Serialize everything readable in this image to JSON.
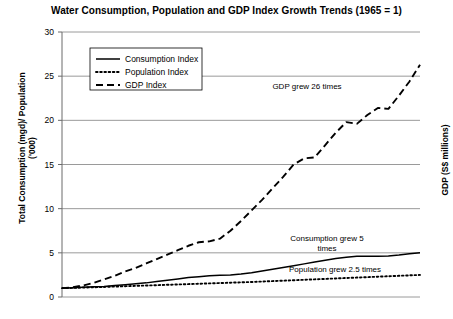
{
  "chart_data": {
    "type": "line",
    "title": "Water Consumption, Population and GDP Index Growth Trends (1965 = 1)",
    "xlabel": "",
    "ylabel": "Total Consumption (mgd)/ Population ('000)",
    "ylabel_right": "GDP (S$ millions)",
    "ylim": [
      0,
      30
    ],
    "yticks": [
      0,
      5,
      10,
      15,
      20,
      25,
      30
    ],
    "ytick_labels": [
      "0",
      "5",
      "10",
      "15",
      "20",
      "25",
      "30"
    ],
    "xlim": [
      0,
      34
    ],
    "xticks": [],
    "xtick_labels": [],
    "grid": "horizontal",
    "legend_position": "upper-left-inside",
    "x": [
      0,
      1,
      2,
      3,
      4,
      5,
      6,
      7,
      8,
      9,
      10,
      11,
      12,
      13,
      14,
      15,
      16,
      17,
      18,
      19,
      20,
      21,
      22,
      23,
      24,
      25,
      26,
      27,
      28,
      29,
      30,
      31,
      32,
      33,
      34
    ],
    "series": [
      {
        "name": "Consumption Index",
        "style": "solid",
        "color": "#000000",
        "values": [
          1.0,
          1.05,
          1.1,
          1.15,
          1.2,
          1.3,
          1.4,
          1.5,
          1.6,
          1.75,
          1.9,
          2.05,
          2.2,
          2.3,
          2.4,
          2.45,
          2.5,
          2.6,
          2.75,
          2.95,
          3.15,
          3.35,
          3.55,
          3.75,
          3.95,
          4.15,
          4.35,
          4.5,
          4.6,
          4.6,
          4.6,
          4.65,
          4.75,
          4.9,
          5.0
        ]
      },
      {
        "name": "Population Index",
        "style": "dotted",
        "color": "#000000",
        "values": [
          1.0,
          1.03,
          1.07,
          1.1,
          1.14,
          1.18,
          1.22,
          1.26,
          1.3,
          1.34,
          1.38,
          1.42,
          1.46,
          1.5,
          1.54,
          1.58,
          1.62,
          1.66,
          1.7,
          1.75,
          1.8,
          1.85,
          1.9,
          1.95,
          2.0,
          2.05,
          2.1,
          2.15,
          2.2,
          2.25,
          2.3,
          2.35,
          2.4,
          2.45,
          2.5
        ]
      },
      {
        "name": "GDP Index",
        "style": "dashed",
        "color": "#000000",
        "values": [
          1.0,
          1.1,
          1.3,
          1.6,
          2.0,
          2.4,
          2.9,
          3.3,
          3.8,
          4.3,
          4.8,
          5.3,
          5.8,
          6.2,
          6.3,
          6.6,
          7.5,
          8.6,
          9.8,
          11.0,
          12.3,
          13.6,
          15.0,
          15.7,
          15.8,
          17.2,
          18.6,
          19.8,
          19.6,
          20.6,
          21.4,
          21.3,
          22.8,
          24.4,
          26.3
        ]
      }
    ],
    "annotations": [
      {
        "text": "GDP grew 26 times",
        "x_px": 307,
        "y_px": 89
      },
      {
        "text": "Consumption grew 5",
        "x_px": 327,
        "y_px": 241
      },
      {
        "text": "times",
        "x_px": 327,
        "y_px": 251
      },
      {
        "text": "Population grew 2.5 times",
        "x_px": 335,
        "y_px": 272
      }
    ]
  },
  "legend": {
    "items": [
      {
        "label": "Consumption Index",
        "style": "solid"
      },
      {
        "label": "Population Index",
        "style": "dotted"
      },
      {
        "label": "GDP Index",
        "style": "dashed"
      }
    ]
  }
}
